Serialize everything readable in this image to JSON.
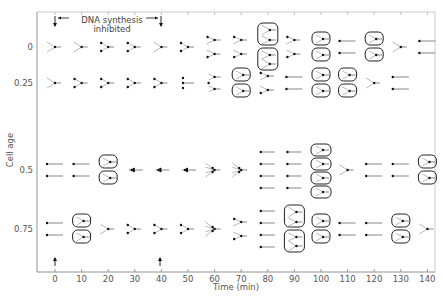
{
  "figure": {
    "annotation_line1": "DNA  synthesis",
    "annotation_line2": "inhibited",
    "xlabel": "Time  (min)",
    "ylabel": "Cell age",
    "x_ticks": [
      "0",
      "10",
      "20",
      "30",
      "40",
      "50",
      "60",
      "70",
      "80",
      "90",
      "100",
      "110",
      "120",
      "130",
      "140"
    ],
    "y_ticks": [
      {
        "label": "0",
        "y": 47
      },
      {
        "label": "0.25",
        "y": 83
      },
      {
        "label": "0.5",
        "y": 170
      },
      {
        "label": "0.75",
        "y": 229
      }
    ],
    "inhibition_start_min": 0,
    "inhibition_end_min": 40
  },
  "rows": [
    {
      "age": "0",
      "y": 47,
      "glyphs": [
        {
          "t": 0,
          "type": "fork"
        },
        {
          "t": 10,
          "type": "fork"
        },
        {
          "t": 20,
          "type": "fork2"
        },
        {
          "t": 30,
          "type": "fork2"
        },
        {
          "t": 40,
          "type": "fork"
        },
        {
          "t": 50,
          "type": "fork2"
        },
        {
          "t": 60,
          "type": "double_fork"
        },
        {
          "t": 70,
          "type": "double_fork"
        },
        {
          "t": 80,
          "type": "boxed_pair_tall"
        },
        {
          "t": 90,
          "type": "double_fork"
        },
        {
          "t": 100,
          "type": "boxed_pair"
        },
        {
          "t": 110,
          "type": "double_line"
        },
        {
          "t": 120,
          "type": "boxed_pair"
        },
        {
          "t": 130,
          "type": "fork"
        },
        {
          "t": 140,
          "type": "double_line"
        }
      ]
    },
    {
      "age": "0.25",
      "y": 83,
      "glyphs": [
        {
          "t": 0,
          "type": "fork"
        },
        {
          "t": 10,
          "type": "fork2"
        },
        {
          "t": 20,
          "type": "fork2"
        },
        {
          "t": 30,
          "type": "fork2"
        },
        {
          "t": 40,
          "type": "fork2"
        },
        {
          "t": 50,
          "type": "triple_line"
        },
        {
          "t": 60,
          "type": "triple_fork"
        },
        {
          "t": 70,
          "type": "boxed_pair"
        },
        {
          "t": 80,
          "type": "double_fork"
        },
        {
          "t": 90,
          "type": "double_line"
        },
        {
          "t": 100,
          "type": "boxed_pair"
        },
        {
          "t": 110,
          "type": "boxed_pair"
        },
        {
          "t": 120,
          "type": "fork"
        },
        {
          "t": 130,
          "type": "double_line"
        }
      ]
    },
    {
      "age": "0.5",
      "y": 170,
      "glyphs": [
        {
          "t": 0,
          "type": "double_line"
        },
        {
          "t": 10,
          "type": "double_line"
        },
        {
          "t": 20,
          "type": "boxed_pair"
        },
        {
          "t": 30,
          "type": "dot_line"
        },
        {
          "t": 40,
          "type": "dot_line"
        },
        {
          "t": 50,
          "type": "dot_line"
        },
        {
          "t": 60,
          "type": "multi_fork"
        },
        {
          "t": 70,
          "type": "multi_fork"
        },
        {
          "t": 80,
          "type": "quad_line"
        },
        {
          "t": 90,
          "type": "quad_line"
        },
        {
          "t": 100,
          "type": "boxed_quad"
        },
        {
          "t": 110,
          "type": "fork"
        },
        {
          "t": 120,
          "type": "double_line"
        },
        {
          "t": 130,
          "type": "double_line"
        },
        {
          "t": 140,
          "type": "boxed_pair"
        }
      ]
    },
    {
      "age": "0.75",
      "y": 229,
      "glyphs": [
        {
          "t": 0,
          "type": "double_line"
        },
        {
          "t": 10,
          "type": "boxed_pair"
        },
        {
          "t": 20,
          "type": "fork"
        },
        {
          "t": 30,
          "type": "fork2"
        },
        {
          "t": 40,
          "type": "fork2"
        },
        {
          "t": 50,
          "type": "fork2"
        },
        {
          "t": 60,
          "type": "multi_fork"
        },
        {
          "t": 70,
          "type": "double_fork"
        },
        {
          "t": 80,
          "type": "quad_line"
        },
        {
          "t": 90,
          "type": "boxed_pair_tall"
        },
        {
          "t": 100,
          "type": "boxed_pair"
        },
        {
          "t": 110,
          "type": "double_line"
        },
        {
          "t": 120,
          "type": "double_line"
        },
        {
          "t": 130,
          "type": "boxed_pair"
        },
        {
          "t": 140,
          "type": "fork"
        }
      ]
    }
  ]
}
